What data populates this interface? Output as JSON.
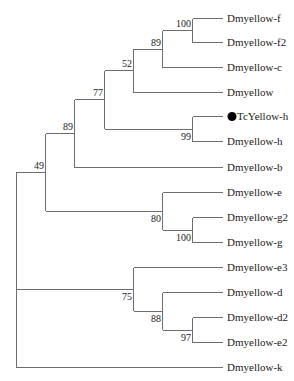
{
  "tree": {
    "type": "phylogenetic-tree",
    "leaf_x": 222,
    "label_x": 227,
    "leaves": [
      {
        "id": "f",
        "label": "Dmyellow-f",
        "y": 18
      },
      {
        "id": "f2",
        "label": "Dmyellow-f2",
        "y": 42
      },
      {
        "id": "c",
        "label": "Dmyellow-c",
        "y": 67
      },
      {
        "id": "y",
        "label": "Dmyellow",
        "y": 92
      },
      {
        "id": "tch",
        "label": "TcYellow-h",
        "y": 116,
        "marker": "filled-circle"
      },
      {
        "id": "h",
        "label": "Dmyellow-h",
        "y": 141
      },
      {
        "id": "b",
        "label": "Dmyellow-b",
        "y": 167
      },
      {
        "id": "e",
        "label": "Dmyellow-e",
        "y": 192
      },
      {
        "id": "g2",
        "label": "Dmyellow-g2",
        "y": 217
      },
      {
        "id": "g",
        "label": "Dmyellow-g",
        "y": 242
      },
      {
        "id": "e3",
        "label": "Dmyellow-e3",
        "y": 267
      },
      {
        "id": "d",
        "label": "Dmyellow-d",
        "y": 292
      },
      {
        "id": "d2",
        "label": "Dmyellow-d2",
        "y": 317
      },
      {
        "id": "e2",
        "label": "Dmyellow-e2",
        "y": 342
      },
      {
        "id": "k",
        "label": "Dmyellow-k",
        "y": 367
      }
    ],
    "nodes": [
      {
        "id": "n_ff2",
        "x": 192,
        "children": [
          "f",
          "f2"
        ],
        "support": "100",
        "label_pos": "above"
      },
      {
        "id": "n_ff2c",
        "x": 162,
        "children": [
          "n_ff2",
          "c"
        ],
        "support": "89",
        "label_pos": "above"
      },
      {
        "id": "n_52",
        "x": 133,
        "children": [
          "n_ff2c",
          "y"
        ],
        "support": "52",
        "label_pos": "above"
      },
      {
        "id": "n_hh",
        "x": 192,
        "children": [
          "tch",
          "h"
        ],
        "support": "99",
        "label_pos": "below"
      },
      {
        "id": "n_77",
        "x": 104,
        "children": [
          "n_52",
          "n_hh"
        ],
        "support": "77",
        "label_pos": "above"
      },
      {
        "id": "n_89",
        "x": 74,
        "children": [
          "n_77",
          "b"
        ],
        "support": "89",
        "label_pos": "above"
      },
      {
        "id": "n_gg2",
        "x": 192,
        "children": [
          "g2",
          "g"
        ],
        "support": "100",
        "label_pos": "below"
      },
      {
        "id": "n_80",
        "x": 162,
        "children": [
          "e",
          "n_gg2"
        ],
        "support": "80",
        "label_pos": "below"
      },
      {
        "id": "n_49",
        "x": 45,
        "children": [
          "n_89",
          "n_80"
        ],
        "support": "49",
        "label_pos": "above"
      },
      {
        "id": "n_97",
        "x": 192,
        "children": [
          "d2",
          "e2"
        ],
        "support": "97",
        "label_pos": "below"
      },
      {
        "id": "n_88",
        "x": 162,
        "children": [
          "d",
          "n_97"
        ],
        "support": "88",
        "label_pos": "below"
      },
      {
        "id": "n_75",
        "x": 133,
        "children": [
          "e3",
          "n_88"
        ],
        "support": "75",
        "label_pos": "below"
      },
      {
        "id": "root",
        "x": 16,
        "children": [
          "n_49",
          "n_75",
          "k"
        ],
        "support": "",
        "label_pos": "none"
      }
    ]
  }
}
